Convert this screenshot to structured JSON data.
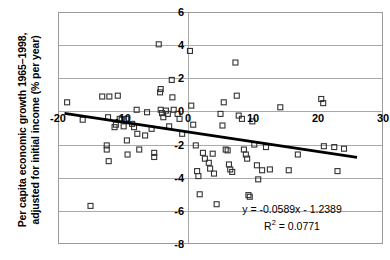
{
  "chart_data": {
    "type": "scatter",
    "title": "",
    "xlabel": "",
    "ylabel": "Per capita economic growth 1965–1998, adjusted for initial income (% per year)",
    "ylabel_line1": "Per capita economic growth 1965–1998,",
    "ylabel_line2": "adjusted for initial income (% per year)",
    "xlim": [
      -20,
      30
    ],
    "ylim": [
      -8,
      6
    ],
    "xticks": [
      -20,
      -10,
      0,
      10,
      20,
      30
    ],
    "xtick_labels": [
      "-20",
      "-10",
      "0",
      "10",
      "20",
      "30"
    ],
    "yticks": [
      6,
      4,
      2,
      0,
      -2,
      -4,
      -6,
      -8
    ],
    "ytick_labels": [
      "6",
      "4",
      "2",
      "0",
      "-2",
      "-4",
      "-6",
      "-8"
    ],
    "grid": true,
    "grid_color": "#aaaaaa",
    "legend": false,
    "marker": "open-square",
    "marker_size": 5,
    "marker_color": "#333333",
    "annotations": [
      {
        "text": "y = -0.0589x - 1.2389",
        "x": 12,
        "y": -6.1
      },
      {
        "text": "R² = 0.0771",
        "x": 12,
        "y": -6.9
      }
    ],
    "trendline": {
      "type": "linear",
      "slope": -0.0589,
      "intercept": -1.2389,
      "equation": "y = -0.0589x - 1.2389",
      "r_squared": 0.0771,
      "r_squared_label": "R",
      "r_squared_sup": "2",
      "r_squared_value": "= 0.0771",
      "color": "#000000",
      "width": 2.6,
      "x_start": -19,
      "x_end": 26
    },
    "points": [
      {
        "x": -18.6,
        "y": 0.55
      },
      {
        "x": -16.2,
        "y": -0.5
      },
      {
        "x": -15.0,
        "y": -5.7
      },
      {
        "x": -13.2,
        "y": 0.9
      },
      {
        "x": -12.1,
        "y": 0.9
      },
      {
        "x": -12.3,
        "y": -0.35
      },
      {
        "x": -12.5,
        "y": -2.05
      },
      {
        "x": -12.5,
        "y": -2.3
      },
      {
        "x": -12.2,
        "y": -3.0
      },
      {
        "x": -11.3,
        "y": -0.95
      },
      {
        "x": -11.1,
        "y": -0.8
      },
      {
        "x": -10.8,
        "y": 0.95
      },
      {
        "x": -10.5,
        "y": -0.45
      },
      {
        "x": -10.2,
        "y": -0.5
      },
      {
        "x": -9.9,
        "y": -0.9
      },
      {
        "x": -9.5,
        "y": -0.45
      },
      {
        "x": -9.4,
        "y": -1.75
      },
      {
        "x": -9.3,
        "y": -2.6
      },
      {
        "x": -8.6,
        "y": -0.75
      },
      {
        "x": -8.3,
        "y": -0.95
      },
      {
        "x": -7.9,
        "y": 0.1
      },
      {
        "x": -7.8,
        "y": -1.35
      },
      {
        "x": -7.5,
        "y": -2.3
      },
      {
        "x": -6.6,
        "y": -1.45
      },
      {
        "x": -6.3,
        "y": -0.05
      },
      {
        "x": -5.6,
        "y": -1.05
      },
      {
        "x": -5.2,
        "y": -2.5
      },
      {
        "x": -5.2,
        "y": -2.75
      },
      {
        "x": -4.5,
        "y": 4.05
      },
      {
        "x": -4.2,
        "y": 1.35
      },
      {
        "x": -4.3,
        "y": 1.15
      },
      {
        "x": -4.2,
        "y": 0.1
      },
      {
        "x": -4.0,
        "y": -0.1
      },
      {
        "x": -3.8,
        "y": -0.35
      },
      {
        "x": -3.4,
        "y": 0.05
      },
      {
        "x": -3.1,
        "y": -0.15
      },
      {
        "x": -2.9,
        "y": -0.9
      },
      {
        "x": -2.5,
        "y": 1.9
      },
      {
        "x": -2.4,
        "y": 0.85
      },
      {
        "x": -2.2,
        "y": 0.1
      },
      {
        "x": -1.6,
        "y": -0.15
      },
      {
        "x": -1.3,
        "y": -0.45
      },
      {
        "x": -0.9,
        "y": -1.35
      },
      {
        "x": 0.3,
        "y": 3.65
      },
      {
        "x": 0.5,
        "y": 0.35
      },
      {
        "x": 0.8,
        "y": -0.8
      },
      {
        "x": 1.2,
        "y": -2.05
      },
      {
        "x": 1.4,
        "y": -3.6
      },
      {
        "x": 1.6,
        "y": -3.9
      },
      {
        "x": 1.8,
        "y": -5.0
      },
      {
        "x": 2.3,
        "y": -2.5
      },
      {
        "x": 2.6,
        "y": -2.85
      },
      {
        "x": 3.2,
        "y": -3.1
      },
      {
        "x": 3.4,
        "y": -3.45
      },
      {
        "x": 3.8,
        "y": -2.55
      },
      {
        "x": 4.0,
        "y": -3.75
      },
      {
        "x": 4.4,
        "y": -5.6
      },
      {
        "x": 5.0,
        "y": -0.15
      },
      {
        "x": 5.3,
        "y": -0.85
      },
      {
        "x": 5.5,
        "y": 0.55
      },
      {
        "x": 5.8,
        "y": -2.3
      },
      {
        "x": 6.1,
        "y": -2.35
      },
      {
        "x": 6.3,
        "y": -3.2
      },
      {
        "x": 6.5,
        "y": -3.5
      },
      {
        "x": 6.8,
        "y": -3.65
      },
      {
        "x": 7.3,
        "y": 2.95
      },
      {
        "x": 7.5,
        "y": 0.95
      },
      {
        "x": 7.8,
        "y": -0.25
      },
      {
        "x": 8.3,
        "y": -0.45
      },
      {
        "x": 8.6,
        "y": -2.3
      },
      {
        "x": 8.9,
        "y": -2.6
      },
      {
        "x": 9.1,
        "y": -2.85
      },
      {
        "x": 9.3,
        "y": -5.05
      },
      {
        "x": 9.5,
        "y": -5.15
      },
      {
        "x": 9.9,
        "y": -0.6
      },
      {
        "x": 10.2,
        "y": -2.0
      },
      {
        "x": 10.6,
        "y": -3.25
      },
      {
        "x": 10.8,
        "y": -4.1
      },
      {
        "x": 11.4,
        "y": -3.55
      },
      {
        "x": 12.0,
        "y": -2.15
      },
      {
        "x": 12.6,
        "y": -3.5
      },
      {
        "x": 14.2,
        "y": 0.25
      },
      {
        "x": 15.5,
        "y": -3.55
      },
      {
        "x": 16.9,
        "y": -2.6
      },
      {
        "x": 20.5,
        "y": 0.75
      },
      {
        "x": 20.8,
        "y": 0.5
      },
      {
        "x": 20.9,
        "y": -2.1
      },
      {
        "x": 22.5,
        "y": -2.15
      },
      {
        "x": 23.0,
        "y": -3.6
      },
      {
        "x": 24.0,
        "y": -2.25
      }
    ]
  }
}
